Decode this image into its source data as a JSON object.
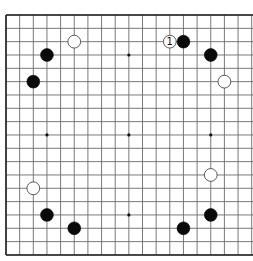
{
  "diagram": {
    "type": "go-board",
    "board_size": 19,
    "visible_columns": 19,
    "cropped_edge": "right",
    "colors": {
      "background": "#ffffff",
      "grid": "#6b6b6b",
      "border": "#222222",
      "black_stone": "#0a0a0a",
      "white_stone": "#ffffff",
      "white_stone_outline": "#333333"
    },
    "star_points": [
      {
        "col": 3,
        "row": 3
      },
      {
        "col": 9,
        "row": 3
      },
      {
        "col": 15,
        "row": 3
      },
      {
        "col": 3,
        "row": 9
      },
      {
        "col": 9,
        "row": 9
      },
      {
        "col": 15,
        "row": 9
      },
      {
        "col": 3,
        "row": 15
      },
      {
        "col": 9,
        "row": 15
      },
      {
        "col": 15,
        "row": 15
      }
    ],
    "stones": [
      {
        "color": "black",
        "col": 3,
        "row": 3,
        "label": ""
      },
      {
        "color": "black",
        "col": 2,
        "row": 5,
        "label": ""
      },
      {
        "color": "white",
        "col": 5,
        "row": 2,
        "label": ""
      },
      {
        "color": "white",
        "col": 12,
        "row": 2,
        "label": "1"
      },
      {
        "color": "black",
        "col": 13,
        "row": 2,
        "label": ""
      },
      {
        "color": "black",
        "col": 15,
        "row": 3,
        "label": ""
      },
      {
        "color": "white",
        "col": 16,
        "row": 5,
        "label": ""
      },
      {
        "color": "white",
        "col": 2,
        "row": 13,
        "label": ""
      },
      {
        "color": "black",
        "col": 3,
        "row": 15,
        "label": ""
      },
      {
        "color": "black",
        "col": 5,
        "row": 16,
        "label": ""
      },
      {
        "color": "white",
        "col": 15,
        "row": 12,
        "label": ""
      },
      {
        "color": "black",
        "col": 15,
        "row": 15,
        "label": ""
      },
      {
        "color": "black",
        "col": 13,
        "row": 16,
        "label": ""
      }
    ],
    "move_labels": [
      {
        "stone_index": 3,
        "text": "1"
      }
    ]
  }
}
